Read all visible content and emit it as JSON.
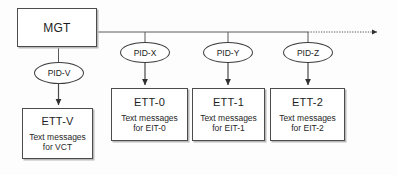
{
  "diagram": {
    "background_color": "#fdfdfd",
    "line_color": "#4c4c4c",
    "text_color": "#1d1d1d"
  },
  "root": {
    "label": "MGT"
  },
  "pids": [
    {
      "id": "pid-v",
      "label": "PID-V"
    },
    {
      "id": "pid-x",
      "label": "PID-X"
    },
    {
      "id": "pid-y",
      "label": "PID-Y"
    },
    {
      "id": "pid-z",
      "label": "PID-Z"
    }
  ],
  "tables": [
    {
      "id": "ett-v",
      "title": "ETT-V",
      "body": "Text messages\nfor  VCT"
    },
    {
      "id": "ett-0",
      "title": "ETT-0",
      "body": "Text messages\nfor EIT-0"
    },
    {
      "id": "ett-1",
      "title": "ETT-1",
      "body": "Text messages\nfor EIT-1"
    },
    {
      "id": "ett-2",
      "title": "ETT-2",
      "body": "Text messages\nfor EIT-2"
    }
  ],
  "bus": {
    "solid_from_x": 97,
    "dotted_from_x": 308,
    "y": 32,
    "arrow_x": 377,
    "style": "solid-then-dotted-with-arrow"
  }
}
